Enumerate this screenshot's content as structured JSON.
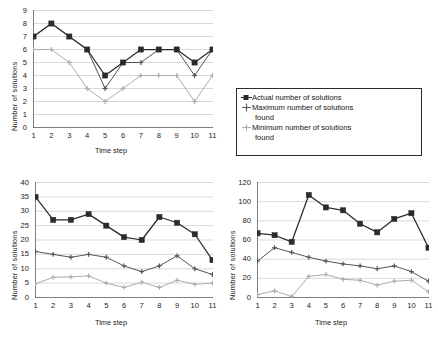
{
  "figure": {
    "background": "#ffffff",
    "panels": [
      "top",
      "bottom-left",
      "bottom-right"
    ]
  },
  "legend": {
    "items": [
      {
        "label": "Actual number of solutions",
        "marker": "filled-square-marker",
        "color": "#2b2b2b"
      },
      {
        "label": "Maximum number of solutions",
        "label_cont": "found",
        "marker": "cross-marker",
        "color": "#555555"
      },
      {
        "label": "Minimum number of solutions",
        "label_cont": "found",
        "marker": "cross-marker",
        "color": "#adadad"
      }
    ]
  },
  "chart_data": [
    {
      "id": "top",
      "type": "line",
      "title": "",
      "xlabel": "Time step",
      "ylabel": "Number of solutions",
      "x": [
        1,
        2,
        3,
        4,
        5,
        6,
        7,
        8,
        9,
        10,
        11
      ],
      "xticklabels": [
        "1",
        "2",
        "3",
        "4",
        "5",
        "6",
        "7",
        "8",
        "9",
        "10",
        "11"
      ],
      "yticklabels": [
        "0",
        "1",
        "2",
        "3",
        "4",
        "5",
        "6",
        "7",
        "8",
        "9"
      ],
      "ylim": [
        0,
        9
      ],
      "ytick_step": 1,
      "grid": "horizontal",
      "legend_position": "external-right",
      "series": [
        {
          "name": "Actual number of solutions",
          "color": "#2b2b2b",
          "marker": "square",
          "values": [
            7,
            8,
            7,
            6,
            4,
            5,
            6,
            6,
            6,
            5,
            6
          ]
        },
        {
          "name": "Maximum number of solutions found",
          "color": "#555555",
          "marker": "cross",
          "values": [
            7,
            8,
            7,
            6,
            3,
            5,
            5,
            6,
            6,
            4,
            6
          ]
        },
        {
          "name": "Minimum number of solutions found",
          "color": "#adadad",
          "marker": "cross",
          "values": [
            6,
            6,
            5,
            3,
            2,
            3,
            4,
            4,
            4,
            2,
            4
          ]
        }
      ]
    },
    {
      "id": "bottom-left",
      "type": "line",
      "title": "",
      "xlabel": "Time step",
      "ylabel": "Number of solutions",
      "x": [
        1,
        2,
        3,
        4,
        5,
        6,
        7,
        8,
        9,
        10,
        11
      ],
      "xticklabels": [
        "1",
        "2",
        "3",
        "4",
        "5",
        "6",
        "7",
        "8",
        "9",
        "10",
        "11"
      ],
      "yticklabels": [
        "0",
        "5",
        "10",
        "15",
        "20",
        "25",
        "30",
        "35",
        "40"
      ],
      "ylim": [
        0,
        40
      ],
      "ytick_step": 5,
      "grid": "horizontal",
      "legend_position": "none",
      "series": [
        {
          "name": "Actual number of solutions",
          "color": "#2b2b2b",
          "marker": "square",
          "values": [
            35,
            27,
            27,
            29,
            25,
            21,
            20,
            28,
            26,
            22,
            13
          ]
        },
        {
          "name": "Maximum number of solutions found",
          "color": "#555555",
          "marker": "cross",
          "values": [
            16,
            15,
            14,
            15,
            14,
            11,
            9,
            11,
            14.5,
            10,
            8
          ]
        },
        {
          "name": "Minimum number of solutions found",
          "color": "#adadad",
          "marker": "cross",
          "values": [
            4.8,
            7,
            7.2,
            7.5,
            5,
            3.5,
            5.3,
            3.5,
            6,
            4.6,
            5
          ]
        }
      ]
    },
    {
      "id": "bottom-right",
      "type": "line",
      "title": "",
      "xlabel": "Time step",
      "ylabel": "Number of solutions",
      "x": [
        1,
        2,
        3,
        4,
        5,
        6,
        7,
        8,
        9,
        10,
        11
      ],
      "xticklabels": [
        "1",
        "2",
        "3",
        "4",
        "5",
        "6",
        "7",
        "8",
        "9",
        "10",
        "11"
      ],
      "yticklabels": [
        "0",
        "20",
        "40",
        "60",
        "80",
        "100",
        "120"
      ],
      "ylim": [
        0,
        120
      ],
      "ytick_step": 20,
      "grid": "horizontal",
      "legend_position": "none",
      "series": [
        {
          "name": "Actual number of solutions",
          "color": "#2b2b2b",
          "marker": "square",
          "values": [
            67,
            65,
            58,
            107,
            94,
            91,
            77,
            68,
            82,
            88,
            52
          ]
        },
        {
          "name": "Maximum number of solutions found",
          "color": "#555555",
          "marker": "cross",
          "values": [
            38,
            52,
            47,
            42,
            38,
            35,
            33,
            30,
            33,
            27,
            17
          ]
        },
        {
          "name": "Minimum number of solutions found",
          "color": "#adadad",
          "marker": "cross",
          "values": [
            3,
            7,
            1,
            22,
            24,
            19,
            18,
            13,
            17,
            18,
            6
          ]
        }
      ]
    }
  ]
}
